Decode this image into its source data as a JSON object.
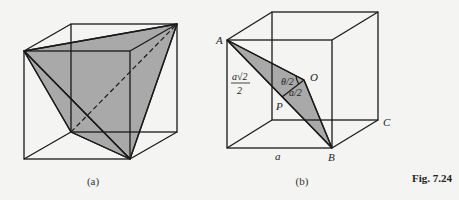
{
  "figure": {
    "label": "Fig. 7.24",
    "panels": [
      {
        "id": "a",
        "caption": "(a)",
        "description": "Cube with shaded triangular cross-section through three vertices and dashed body diagonal"
      },
      {
        "id": "b",
        "caption": "(b)",
        "description": "Cube with shaded triangle AOB where O is the cube center",
        "labels": {
          "A": "A",
          "B": "B",
          "C": "C",
          "O": "O",
          "P": "P",
          "edge": "a",
          "angle": "θ/2",
          "half_edge": "a/2",
          "half_diag_num": "a√2",
          "half_diag_den": "2"
        }
      }
    ],
    "shade_color": "#a9a9a9",
    "line_color": "#1a1a1a"
  }
}
